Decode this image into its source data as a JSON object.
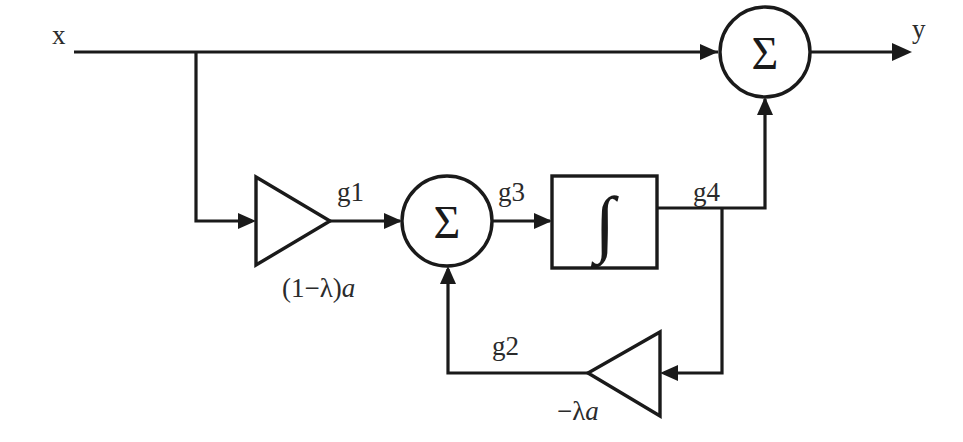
{
  "diagram": {
    "signals": {
      "input_label": "x",
      "output_label": "y",
      "g1": "g1",
      "g2": "g2",
      "g3": "g3",
      "g4": "g4"
    },
    "blocks": {
      "gain_forward": {
        "name": "forward-gain-triangle",
        "label_prefix": "(1−λ)",
        "label_var": "a",
        "label_full": "(1−λ)a",
        "direction": "right"
      },
      "gain_feedback": {
        "name": "feedback-gain-triangle",
        "label_prefix": "−λ",
        "label_var": "a",
        "label_full": "−λa",
        "direction": "left"
      },
      "summing_inner": {
        "name": "inner-summing-junction",
        "symbol": "Σ"
      },
      "summing_output": {
        "name": "output-summing-junction",
        "symbol": "Σ"
      },
      "integrator": {
        "name": "integrator-block",
        "symbol": "∫"
      }
    },
    "style": {
      "line_color": "#1a1a1a",
      "text_color": "#2b2b2b",
      "background": "#ffffff"
    }
  }
}
